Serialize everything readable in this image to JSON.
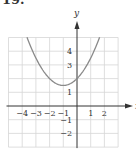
{
  "problem_number": "19.",
  "chart_data": {
    "type": "line",
    "title": "",
    "xlabel": "x",
    "ylabel": "y",
    "xlim": [
      -5,
      3
    ],
    "ylim": [
      -3,
      5
    ],
    "grid": true,
    "x_ticks": [
      "-4",
      "-3",
      "-2",
      "-1",
      "1",
      "2"
    ],
    "y_ticks": [
      "4",
      "3",
      "1",
      "-1",
      "-2"
    ],
    "series": [
      {
        "name": "parabola",
        "equation": "y = 0.5(x+1)^2 + 1.5",
        "vertex": [
          -1,
          1.5
        ],
        "x": [
          -3.65,
          -3,
          -2,
          -1,
          0,
          1,
          1.65
        ],
        "y": [
          5.0,
          3.5,
          2.0,
          1.5,
          2.0,
          3.5,
          5.0
        ]
      }
    ]
  },
  "colors": {
    "grid": "#d6d6d6",
    "axis": "#333333",
    "curve": "#8a8a8a"
  }
}
